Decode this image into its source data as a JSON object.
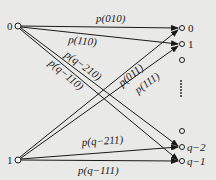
{
  "diagram": {
    "type": "channel-transition-graph",
    "left_nodes": [
      {
        "id": "in0",
        "label": "0",
        "x": 18,
        "y": 26
      },
      {
        "id": "in1",
        "label": "1",
        "x": 18,
        "y": 160
      }
    ],
    "right_nodes": [
      {
        "id": "out0",
        "label": "0",
        "x": 182,
        "y": 28
      },
      {
        "id": "out1",
        "label": "1",
        "x": 182,
        "y": 44
      },
      {
        "id": "out2",
        "label": "",
        "x": 182,
        "y": 60
      },
      {
        "id": "outq3",
        "label": "",
        "x": 182,
        "y": 131
      },
      {
        "id": "outq2",
        "label": "q−2",
        "x": 182,
        "y": 147
      },
      {
        "id": "outq1",
        "label": "q−1",
        "x": 182,
        "y": 161
      }
    ],
    "ellipsis": "⋮",
    "edges": [
      {
        "from": "in0",
        "to": "out0",
        "label": "p(010)"
      },
      {
        "from": "in0",
        "to": "out1",
        "label": "p(110)"
      },
      {
        "from": "in0",
        "to": "outq2",
        "label": "p(q−210)"
      },
      {
        "from": "in0",
        "to": "outq1",
        "label": "p(q−110)"
      },
      {
        "from": "in1",
        "to": "out0",
        "label": "p(011)"
      },
      {
        "from": "in1",
        "to": "out1",
        "label": "p(111)"
      },
      {
        "from": "in1",
        "to": "outq2",
        "label": "p(q−211)"
      },
      {
        "from": "in1",
        "to": "outq1",
        "label": "p(q−111)"
      }
    ]
  },
  "labels": {
    "in0": "0",
    "in1": "1",
    "out0": "0",
    "out1": "1",
    "outq2": "q−2",
    "outq1": "q−1",
    "e_010": "p(010)",
    "e_110": "p(110)",
    "e_q210": "p(q−210)",
    "e_q110": "p(q−110)",
    "e_011": "p(011)",
    "e_111": "p(111)",
    "e_q211": "p(q−211)",
    "e_q111": "p(q−111)"
  }
}
